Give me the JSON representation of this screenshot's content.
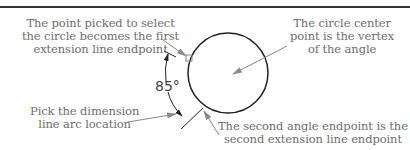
{
  "diagram": {
    "callouts": {
      "first_point": {
        "lines": [
          "The point picked to select",
          "the circle becomes the first",
          "extension line endpoint"
        ]
      },
      "center_vertex": {
        "lines": [
          "The circle center",
          "point is the vertex",
          "of the angle"
        ]
      },
      "arc_location": {
        "lines": [
          "Pick the dimension",
          "line arc location"
        ]
      },
      "second_point": {
        "lines": [
          "The second angle endpoint is the",
          "second extension line endpoint"
        ]
      }
    },
    "dimension_value": "85°",
    "colors": {
      "geometry": "#222222",
      "leader": "#8a8a8a",
      "text": "#6e6e6e",
      "rule": "#333333"
    }
  }
}
